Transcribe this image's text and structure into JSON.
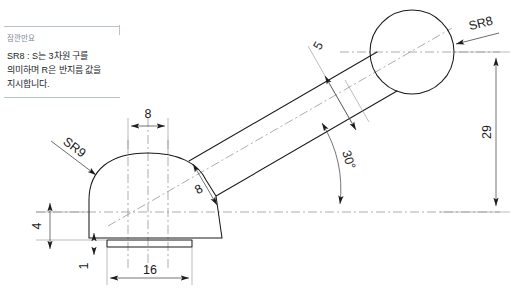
{
  "note": {
    "header": "잠깐만요",
    "body": "SR8 : S는 3차원 구를 의미하며 R은 반지름 값을 지시합니다."
  },
  "drawing": {
    "title": "구면 핸들 레버 단면도",
    "labels": {
      "sphere_radius": "SR8",
      "dome_radius": "SR9",
      "shaft_length": "5",
      "shaft_width": "8",
      "angle": "30°",
      "height": "29",
      "dome_width_top": "8",
      "base_width": "16",
      "dome_height": "4",
      "base_thickness": "1"
    },
    "colors": {
      "outline": "#1b1b1b",
      "center_line": "#8a8a8a",
      "extension_line": "#8f8f8f",
      "dimension_line": "#3a3a3a",
      "note_rule": "#b9c3cf",
      "note_header_text": "#7d8896",
      "background": "#ffffff"
    }
  }
}
